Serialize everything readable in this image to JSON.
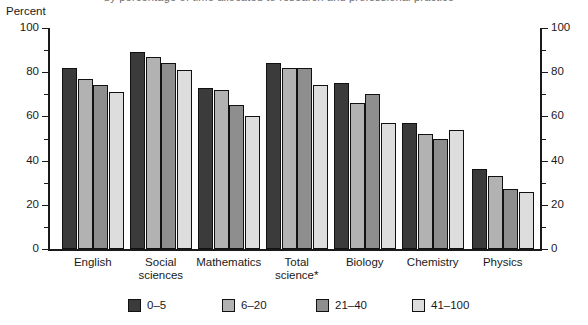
{
  "header": {
    "unit_label": "Percent",
    "clipped_title": "by percentage of time allocated to research and professional practice"
  },
  "chart_data": {
    "type": "bar",
    "title": "",
    "xlabel": "",
    "ylabel": "Percent",
    "ylim": [
      0,
      100
    ],
    "ytick_step": 20,
    "yminor_step": 10,
    "grid": false,
    "dual_axis": true,
    "legend_position": "bottom",
    "categories": [
      "English",
      "Social\nsciences",
      "Mathematics",
      "Total\nscience*",
      "Biology",
      "Chemistry",
      "Physics"
    ],
    "yticks": [
      "0",
      "20",
      "40",
      "60",
      "80",
      "100"
    ],
    "series": [
      {
        "name": "0–5",
        "color": "#3b3b3b",
        "values": [
          82,
          89,
          73,
          84,
          75,
          57,
          36
        ]
      },
      {
        "name": "6–20",
        "color": "#b2b2b2",
        "values": [
          77,
          87,
          72,
          82,
          66,
          52,
          33
        ]
      },
      {
        "name": "21–40",
        "color": "#8e8e8e",
        "values": [
          74,
          84,
          65,
          82,
          70,
          50,
          27
        ]
      },
      {
        "name": "41–100",
        "color": "#dddddd",
        "values": [
          71,
          81,
          60,
          74,
          57,
          54,
          26
        ]
      }
    ],
    "footnote_marker": "*"
  },
  "legend": {
    "items": [
      {
        "label": "0–5"
      },
      {
        "label": "6–20"
      },
      {
        "label": "21–40"
      },
      {
        "label": "41–100"
      }
    ]
  }
}
